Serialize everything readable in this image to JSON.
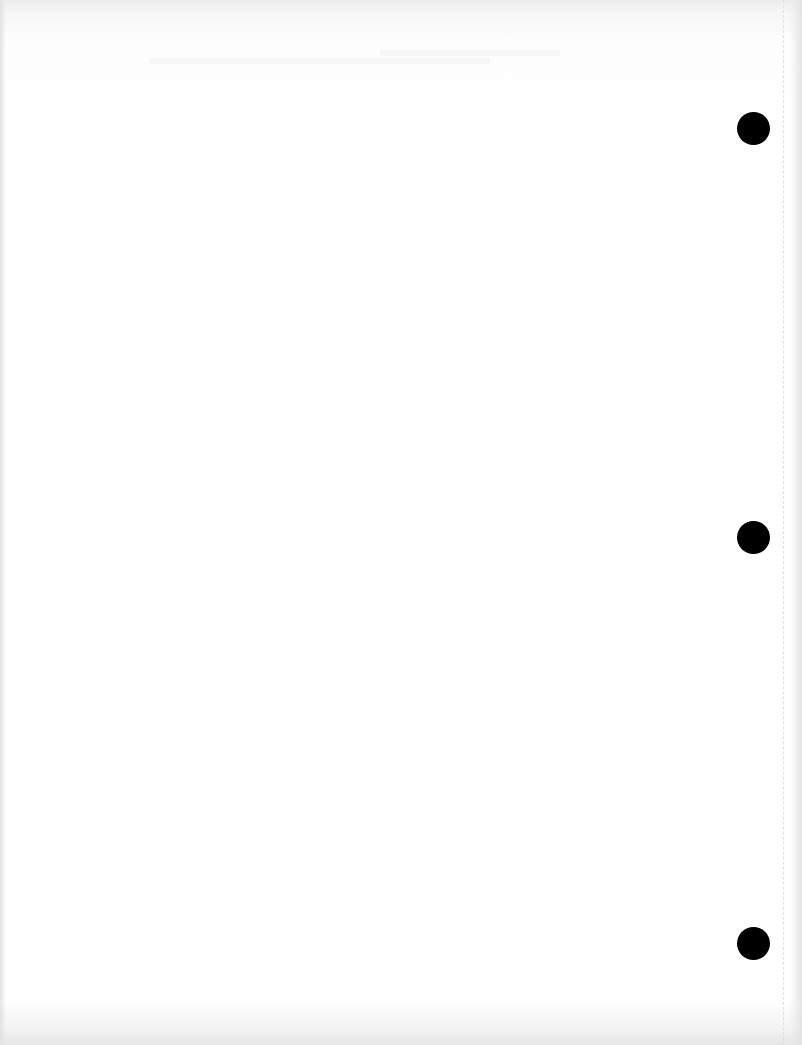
{
  "document": {
    "type": "blank scanned page",
    "background_color": "#ffffff",
    "visible_text": []
  },
  "punch_holes": [
    {
      "name": "top",
      "cx": 753,
      "cy": 128,
      "r": 16,
      "color": "#000000"
    },
    {
      "name": "middle",
      "cx": 753,
      "cy": 537,
      "r": 16,
      "color": "#000000"
    },
    {
      "name": "bottom",
      "cx": 753,
      "cy": 943,
      "r": 16,
      "color": "#000000"
    }
  ]
}
